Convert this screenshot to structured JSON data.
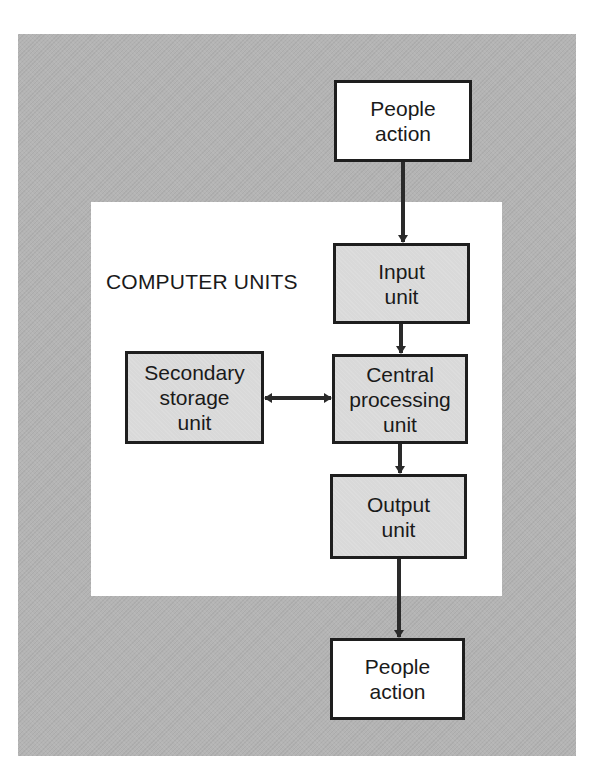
{
  "diagram": {
    "panel_title": "COMPUTER UNITS",
    "nodes": {
      "people_action_top": {
        "label": "People\naction"
      },
      "input_unit": {
        "label": "Input\nunit"
      },
      "cpu": {
        "label": "Central\nprocessing\nunit"
      },
      "secondary_storage": {
        "label": "Secondary\nstorage\nunit"
      },
      "output_unit": {
        "label": "Output\nunit"
      },
      "people_action_bottom": {
        "label": "People\naction"
      }
    },
    "edges": [
      {
        "from": "People action (top)",
        "to": "Input unit",
        "direction": "one-way"
      },
      {
        "from": "Input unit",
        "to": "Central processing unit",
        "direction": "one-way"
      },
      {
        "from": "Secondary storage unit",
        "to": "Central processing unit",
        "direction": "two-way"
      },
      {
        "from": "Central processing unit",
        "to": "Output unit",
        "direction": "one-way"
      },
      {
        "from": "Output unit",
        "to": "People action (bottom)",
        "direction": "one-way"
      }
    ]
  },
  "colors": {
    "outer_frame": "#b4b4b4",
    "inner_panel": "#ffffff",
    "unit_box_fill": "#d9d9d9",
    "people_box_fill": "#ffffff",
    "stroke": "#1e1e1e"
  }
}
